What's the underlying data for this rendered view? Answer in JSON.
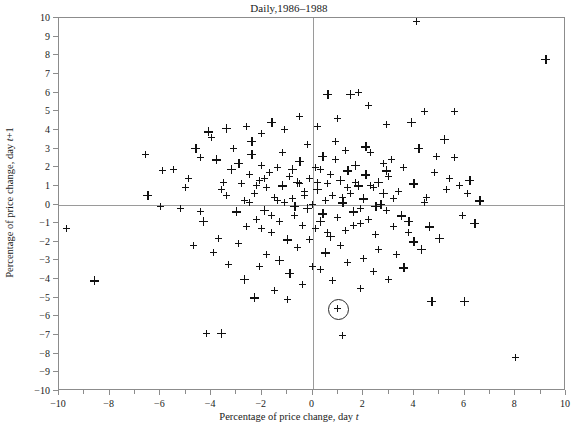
{
  "chart_data": {
    "type": "scatter",
    "title": "Daily,1986–1988",
    "xlabel": "Percentage of price change, day t",
    "ylabel": "Percentage of price change, day t+1",
    "xlim": [
      -10,
      10
    ],
    "ylim": [
      -10,
      10
    ],
    "grid": false,
    "legend": null,
    "marker": "+",
    "zero_lines": {
      "x": 0,
      "y": 0
    },
    "xticks": [
      -10,
      -8,
      -6,
      -4,
      -2,
      0,
      2,
      4,
      6,
      8,
      10
    ],
    "xticks_minor": [
      -9,
      -7,
      -5,
      -3,
      -1,
      1,
      3,
      5,
      7,
      9
    ],
    "yticks": [
      -10,
      -9,
      -8,
      -7,
      -6,
      -5,
      -4,
      -3,
      -2,
      -1,
      0,
      1,
      2,
      3,
      4,
      5,
      6,
      7,
      8,
      9,
      10
    ],
    "xtick_labels": [
      "−10",
      "−8",
      "−6",
      "−4",
      "−2",
      "0",
      "2",
      "4",
      "6",
      "8",
      "10"
    ],
    "ytick_labels": [
      "−10",
      "−9",
      "−8",
      "−7",
      "−6",
      "−5",
      "−4",
      "−3",
      "−2",
      "−1",
      "0",
      "1",
      "2",
      "3",
      "4",
      "5",
      "6",
      "7",
      "8",
      "9",
      "10"
    ],
    "annotation": {
      "type": "circled-point",
      "x": 1.0,
      "y": -5.6,
      "radius_units": 0.4
    },
    "points": [
      [
        4.1,
        9.8
      ],
      [
        9.2,
        7.8
      ],
      [
        8.0,
        -8.2
      ],
      [
        -9.7,
        -1.3
      ],
      [
        -8.6,
        -4.1
      ],
      [
        1.2,
        -7.0
      ],
      [
        -4.2,
        -6.9
      ],
      [
        -3.6,
        -6.9
      ],
      [
        6.0,
        -5.2
      ],
      [
        4.7,
        -5.2
      ],
      [
        1.0,
        -5.6
      ],
      [
        -6.6,
        2.7
      ],
      [
        -5.9,
        1.8
      ],
      [
        -5.5,
        1.9
      ],
      [
        -4.9,
        1.4
      ],
      [
        -6.5,
        0.5
      ],
      [
        -4.6,
        3.0
      ],
      [
        -4.4,
        2.5
      ],
      [
        -4.1,
        3.9
      ],
      [
        -4.0,
        3.6
      ],
      [
        -3.8,
        2.4
      ],
      [
        -3.5,
        1.2
      ],
      [
        -3.4,
        0.5
      ],
      [
        -3.2,
        1.9
      ],
      [
        -3.1,
        3.0
      ],
      [
        -3.0,
        -0.4
      ],
      [
        -2.9,
        2.2
      ],
      [
        -2.8,
        1.1
      ],
      [
        -2.7,
        0.2
      ],
      [
        -2.6,
        -1.2
      ],
      [
        -2.5,
        1.6
      ],
      [
        -2.4,
        2.7
      ],
      [
        -2.3,
        0.6
      ],
      [
        -2.2,
        -0.8
      ],
      [
        -2.1,
        1.3
      ],
      [
        -2.0,
        2.1
      ],
      [
        -1.9,
        -0.3
      ],
      [
        -1.8,
        0.9
      ],
      [
        -1.7,
        1.7
      ],
      [
        -1.6,
        -1.5
      ],
      [
        -1.5,
        0.4
      ],
      [
        -1.4,
        2.0
      ],
      [
        -1.3,
        -0.9
      ],
      [
        -1.2,
        1.0
      ],
      [
        -1.1,
        0.1
      ],
      [
        -1.0,
        -1.9
      ],
      [
        -0.9,
        1.5
      ],
      [
        -0.8,
        0.3
      ],
      [
        -0.7,
        -0.6
      ],
      [
        -0.6,
        1.2
      ],
      [
        -0.5,
        2.3
      ],
      [
        -0.4,
        -1.1
      ],
      [
        -0.3,
        0.7
      ],
      [
        -0.2,
        -0.2
      ],
      [
        -0.1,
        1.4
      ],
      [
        0.0,
        0.0
      ],
      [
        0.1,
        -1.3
      ],
      [
        0.2,
        0.8
      ],
      [
        0.3,
        1.9
      ],
      [
        0.4,
        -0.5
      ],
      [
        0.5,
        0.2
      ],
      [
        0.6,
        1.1
      ],
      [
        0.7,
        -1.7
      ],
      [
        0.8,
        0.5
      ],
      [
        0.9,
        2.4
      ],
      [
        1.0,
        -0.7
      ],
      [
        1.1,
        1.3
      ],
      [
        1.2,
        0.1
      ],
      [
        1.3,
        -1.4
      ],
      [
        1.4,
        1.8
      ],
      [
        1.5,
        0.6
      ],
      [
        1.6,
        -0.4
      ],
      [
        1.7,
        2.1
      ],
      [
        1.8,
        1.0
      ],
      [
        1.9,
        -1.0
      ],
      [
        2.0,
        0.3
      ],
      [
        2.1,
        1.6
      ],
      [
        2.2,
        -0.8
      ],
      [
        2.3,
        2.8
      ],
      [
        2.4,
        0.9
      ],
      [
        2.5,
        -1.6
      ],
      [
        2.6,
        1.2
      ],
      [
        2.7,
        0.0
      ],
      [
        2.8,
        2.2
      ],
      [
        2.9,
        -0.3
      ],
      [
        3.0,
        1.5
      ],
      [
        3.2,
        -1.2
      ],
      [
        3.4,
        0.7
      ],
      [
        3.6,
        2.0
      ],
      [
        3.8,
        -0.9
      ],
      [
        4.0,
        1.1
      ],
      [
        4.3,
        -2.4
      ],
      [
        4.5,
        0.4
      ],
      [
        4.8,
        1.7
      ],
      [
        5.0,
        -1.8
      ],
      [
        5.3,
        0.8
      ],
      [
        5.6,
        2.5
      ],
      [
        5.9,
        -0.6
      ],
      [
        6.2,
        1.3
      ],
      [
        6.6,
        0.2
      ],
      [
        4.4,
        5.0
      ],
      [
        5.6,
        5.0
      ],
      [
        3.9,
        4.4
      ],
      [
        2.9,
        4.3
      ],
      [
        2.2,
        5.3
      ],
      [
        1.8,
        6.0
      ],
      [
        1.5,
        5.9
      ],
      [
        1.0,
        4.6
      ],
      [
        0.6,
        5.9
      ],
      [
        0.2,
        4.2
      ],
      [
        -0.5,
        4.7
      ],
      [
        -1.1,
        4.0
      ],
      [
        -1.6,
        4.4
      ],
      [
        -2.0,
        3.8
      ],
      [
        -2.6,
        4.2
      ],
      [
        -3.4,
        4.1
      ],
      [
        4.2,
        3.0
      ],
      [
        4.9,
        2.6
      ],
      [
        5.4,
        1.4
      ],
      [
        6.1,
        0.6
      ],
      [
        5.2,
        3.5
      ],
      [
        3.6,
        -3.4
      ],
      [
        3.0,
        -4.0
      ],
      [
        2.4,
        -3.6
      ],
      [
        1.9,
        -4.5
      ],
      [
        1.4,
        -3.1
      ],
      [
        0.8,
        -4.1
      ],
      [
        0.3,
        -3.5
      ],
      [
        -0.4,
        -4.3
      ],
      [
        -0.9,
        -3.7
      ],
      [
        -1.5,
        -4.6
      ],
      [
        -2.1,
        -3.3
      ],
      [
        -2.7,
        -4.0
      ],
      [
        -3.3,
        -3.2
      ],
      [
        -2.3,
        -5.0
      ],
      [
        -1.0,
        -5.1
      ],
      [
        4.0,
        -2.0
      ],
      [
        4.6,
        -1.2
      ],
      [
        3.3,
        -2.7
      ],
      [
        2.0,
        -2.9
      ],
      [
        0.5,
        -2.6
      ],
      [
        -0.6,
        -2.3
      ],
      [
        -1.8,
        -2.7
      ],
      [
        -2.9,
        -2.1
      ],
      [
        -3.7,
        -1.8
      ],
      [
        -4.3,
        -0.9
      ],
      [
        -5.2,
        -0.2
      ],
      [
        -4.7,
        -2.2
      ],
      [
        -3.9,
        -2.6
      ],
      [
        -1.3,
        -3.0
      ],
      [
        0.0,
        -3.3
      ],
      [
        1.1,
        -2.2
      ],
      [
        2.6,
        -2.4
      ],
      [
        3.8,
        -1.5
      ],
      [
        -0.2,
        3.2
      ],
      [
        0.9,
        3.4
      ],
      [
        2.1,
        3.1
      ],
      [
        3.1,
        2.4
      ],
      [
        1.3,
        2.9
      ],
      [
        -1.2,
        2.8
      ],
      [
        -2.4,
        3.4
      ],
      [
        0.4,
        2.6
      ],
      [
        -0.8,
        1.9
      ],
      [
        1.7,
        1.2
      ],
      [
        2.8,
        0.6
      ],
      [
        -3.6,
        0.8
      ],
      [
        -5.0,
        0.9
      ],
      [
        -4.4,
        -0.4
      ],
      [
        -2.0,
        -1.3
      ],
      [
        -0.1,
        -1.9
      ],
      [
        1.6,
        -1.1
      ],
      [
        3.5,
        -0.6
      ],
      [
        4.4,
        0.1
      ],
      [
        5.8,
        1.0
      ],
      [
        6.4,
        -1.0
      ],
      [
        -6.0,
        -0.1
      ],
      [
        0.7,
        1.6
      ],
      [
        -0.3,
        0.5
      ],
      [
        1.2,
        0.4
      ],
      [
        2.3,
        1.0
      ],
      [
        -1.4,
        0.2
      ],
      [
        -2.2,
        1.0
      ],
      [
        0.1,
        2.0
      ],
      [
        -0.7,
        -0.1
      ],
      [
        1.9,
        -0.2
      ],
      [
        3.2,
        0.3
      ],
      [
        0.3,
        -0.9
      ],
      [
        -1.6,
        -0.6
      ],
      [
        2.5,
        -0.1
      ],
      [
        -2.5,
        0.1
      ],
      [
        0.6,
        -1.5
      ],
      [
        1.4,
        0.9
      ],
      [
        -1.9,
        1.4
      ],
      [
        2.9,
        1.8
      ],
      [
        -0.5,
        1.1
      ],
      [
        0.2,
        1.2
      ]
    ],
    "point_count_approx": 500,
    "source_description": "Scatter of percentage price change on consecutive trading days"
  }
}
